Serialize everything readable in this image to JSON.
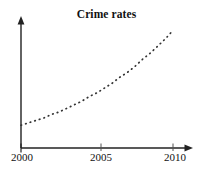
{
  "chart_data": {
    "type": "line",
    "title": "Crime rates",
    "xlabel": "",
    "ylabel": "",
    "legend": null,
    "grid": false,
    "line_style": "dotted",
    "line_color": "#333333",
    "axis_color": "#222222",
    "background": "#ffffff",
    "xlim": [
      2000,
      2010
    ],
    "ylim": [
      0,
      100
    ],
    "xticks": [
      2000,
      2005,
      2010
    ],
    "xtick_labels": [
      "2000",
      "2005",
      "2010"
    ],
    "yticks": [],
    "ytick_labels": [],
    "x": [
      2000,
      2000.5,
      2001,
      2001.5,
      2002,
      2002.5,
      2003,
      2003.5,
      2004,
      2004.5,
      2005,
      2005.5,
      2006,
      2006.5,
      2007,
      2007.5,
      2008,
      2008.5,
      2009,
      2009.5,
      2010
    ],
    "series": [
      {
        "name": "Crime rate",
        "values": [
          19,
          21,
          23,
          25,
          28,
          30,
          33,
          36,
          39,
          43,
          46,
          50,
          54,
          59,
          63,
          68,
          74,
          79,
          85,
          91,
          98
        ]
      }
    ],
    "annotations": []
  },
  "axes": {
    "x_axis_name": "x-axis-year",
    "y_axis_name": "y-axis-rate",
    "x_arrow": true,
    "y_arrow": true
  }
}
